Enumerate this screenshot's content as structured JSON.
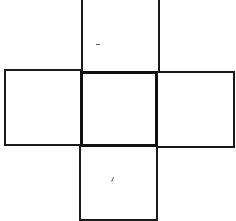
{
  "diagram": {
    "type": "cube-net-cross",
    "squares": [
      {
        "id": "top",
        "x": 81,
        "y": -2,
        "w": 79,
        "h": 75
      },
      {
        "id": "left",
        "x": 4,
        "y": 69,
        "w": 79,
        "h": 77
      },
      {
        "id": "center",
        "x": 80,
        "y": 71,
        "w": 78,
        "h": 76
      },
      {
        "id": "right",
        "x": 156,
        "y": 71,
        "w": 79,
        "h": 77
      },
      {
        "id": "bottom",
        "x": 79,
        "y": 145,
        "w": 79,
        "h": 76
      }
    ],
    "colors": {
      "stroke": "#1a1a1a",
      "background": "#ffffff"
    }
  }
}
